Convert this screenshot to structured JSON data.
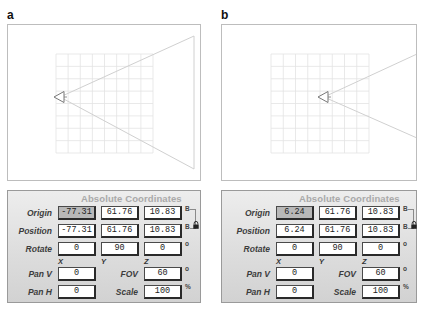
{
  "figures": [
    {
      "label": "a",
      "viewport": {
        "grid": {
          "x": 48,
          "y": 29,
          "width": 97,
          "height": 99,
          "cols": 8,
          "rows": 8,
          "color": "#e3e3e3"
        },
        "camera": {
          "x": 46,
          "y": 72,
          "size": 10
        },
        "cone": {
          "apex_x": 52,
          "apex_y": 72,
          "far_x": 186,
          "top_y": 11,
          "bottom_y": 144
        },
        "cone_color": "#d0d0d0",
        "camera_color": "#777777"
      },
      "panel": {
        "title": "Absolute Coordinates",
        "origin": {
          "label": "Origin",
          "x": "-77.31",
          "y": "61.76",
          "z": "10.83",
          "unit": "B"
        },
        "position": {
          "label": "Position",
          "x": "-77.31",
          "y": "61.76",
          "z": "10.83",
          "unit": "B"
        },
        "rotate": {
          "label": "Rotate",
          "x": "0",
          "y": "90",
          "z": "0",
          "unit": "o"
        },
        "axes": {
          "x": "X",
          "y": "Y",
          "z": "Z"
        },
        "pan_v": {
          "label": "Pan V",
          "value": "0"
        },
        "pan_h": {
          "label": "Pan H",
          "value": "0"
        },
        "fov": {
          "label": "FOV",
          "value": "60",
          "unit": "o"
        },
        "scale": {
          "label": "Scale",
          "value": "100",
          "unit": "%"
        }
      }
    },
    {
      "label": "b",
      "viewport": {
        "grid": {
          "x": 49,
          "y": 29,
          "width": 98,
          "height": 99,
          "cols": 8,
          "rows": 8,
          "color": "#e3e3e3"
        },
        "camera": {
          "x": 96,
          "y": 72,
          "size": 10
        },
        "cone": {
          "apex_x": 102,
          "apex_y": 72,
          "far_x": 195,
          "top_y": 29,
          "bottom_y": 113
        },
        "cone_color": "#d0d0d0",
        "camera_color": "#777777"
      },
      "panel": {
        "title": "Absolute Coordinates",
        "origin": {
          "label": "Origin",
          "x": "6.24",
          "y": "61.76",
          "z": "10.83",
          "unit": "B"
        },
        "position": {
          "label": "Position",
          "x": "6.24",
          "y": "61.76",
          "z": "10.83",
          "unit": "B"
        },
        "rotate": {
          "label": "Rotate",
          "x": "0",
          "y": "90",
          "z": "0",
          "unit": "o"
        },
        "axes": {
          "x": "X",
          "y": "Y",
          "z": "Z"
        },
        "pan_v": {
          "label": "Pan V",
          "value": "0"
        },
        "pan_h": {
          "label": "Pan H",
          "value": "0"
        },
        "fov": {
          "label": "FOV",
          "value": "60",
          "unit": "o"
        },
        "scale": {
          "label": "Scale",
          "value": "100",
          "unit": "%"
        }
      }
    }
  ]
}
